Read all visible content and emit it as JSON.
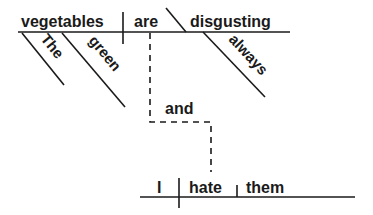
{
  "diagram": {
    "type": "sentence-diagram",
    "clause1": {
      "subject": "vegetables",
      "verb": "are",
      "predicate_adjective": "disgusting",
      "modifiers": {
        "subject": [
          "The",
          "green"
        ],
        "predicate": [
          "always"
        ]
      }
    },
    "conjunction": "and",
    "clause2": {
      "subject": "I",
      "verb": "hate",
      "object": "them"
    },
    "colors": {
      "line": "#1a1a1a",
      "text": "#1a1a1a",
      "background": "#ffffff"
    }
  }
}
